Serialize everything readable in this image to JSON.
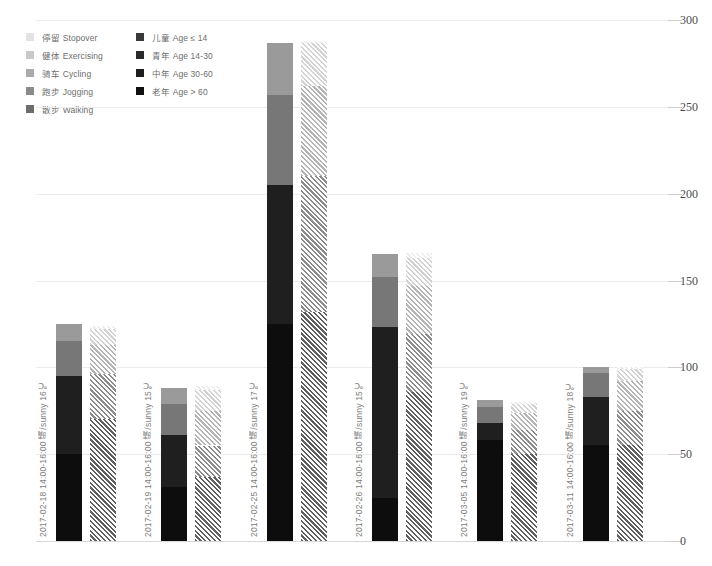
{
  "legend": {
    "activity": [
      {
        "label": "停留 Stopover",
        "color": "#e3e3e3"
      },
      {
        "label": "健体 Exercising",
        "color": "#c9c9c9"
      },
      {
        "label": "骑车 Cycling",
        "color": "#aaaaaa"
      },
      {
        "label": "跑步 Jogging",
        "color": "#8a8a8a"
      },
      {
        "label": "散步 Walking",
        "color": "#6d6d6d"
      }
    ],
    "age": [
      {
        "label": "儿童 Age ≤ 14",
        "color": "#3a3a3a"
      },
      {
        "label": "青年 Age 14-30",
        "color": "#2a2a2a"
      },
      {
        "label": "中年 Age 30-60",
        "color": "#1e1e1e"
      },
      {
        "label": "老年 Age > 60",
        "color": "#101010"
      }
    ]
  },
  "chart_data": {
    "type": "bar",
    "title": "",
    "xlabel": "",
    "ylabel": "",
    "ylim": [
      0,
      300
    ],
    "yticks": [
      0,
      50,
      100,
      150,
      200,
      250,
      300
    ],
    "grid": true,
    "legend_position": "top-left",
    "stacked": true,
    "grouped_pairs": [
      "age",
      "activity"
    ],
    "categories": [
      "2017-02-18  14:00-16:00  晴/sunny  16℃",
      "2017-02-19  14:00-16:00  晴/sunny  15℃",
      "2017-02-25  14:00-16:00  晴/sunny  17℃",
      "2017-02-26  14:00-16:00  晴/sunny  15℃",
      "2017-03-05  14:00-16:00  晴/sunny  19℃",
      "2017-03-11  14:00-16:00  晴/sunny  18℃"
    ],
    "series": [
      {
        "name": "老年 Age > 60",
        "group": "age",
        "color": "#0d0d0d",
        "values": [
          50,
          31,
          125,
          25,
          58,
          55
        ]
      },
      {
        "name": "中年 Age 30-60",
        "group": "age",
        "color": "#1f1f1f",
        "values": [
          45,
          30,
          80,
          98,
          10,
          28
        ]
      },
      {
        "name": "青年 Age 14-30",
        "group": "age",
        "color": "#777777",
        "values": [
          20,
          18,
          52,
          29,
          9,
          14
        ]
      },
      {
        "name": "儿童 Age ≤ 14",
        "group": "age",
        "color": "#9a9a9a",
        "values": [
          10,
          9,
          30,
          13,
          4,
          3
        ]
      },
      {
        "name": "散步 Walking",
        "group": "activity",
        "color": "#5f5f5f",
        "values": [
          70,
          37,
          132,
          86,
          50,
          55
        ]
      },
      {
        "name": "跑步 Jogging",
        "group": "activity",
        "color": "#8c8c8c",
        "values": [
          26,
          18,
          78,
          33,
          14,
          20
        ]
      },
      {
        "name": "骑车 Cycling",
        "group": "activity",
        "color": "#b4b4b4",
        "values": [
          17,
          20,
          52,
          28,
          10,
          17
        ]
      },
      {
        "name": "健体 Exercising",
        "group": "activity",
        "color": "#d2d2d2",
        "values": [
          9,
          12,
          25,
          16,
          5,
          7
        ]
      },
      {
        "name": "停留 Stopover",
        "group": "activity",
        "color": "#ededed",
        "values": [
          2,
          2,
          1,
          3,
          1,
          1
        ]
      }
    ],
    "totals_age": [
      125,
      88,
      287,
      165,
      81,
      100
    ],
    "totals_activity": [
      124,
      89,
      288,
      166,
      80,
      100
    ]
  }
}
